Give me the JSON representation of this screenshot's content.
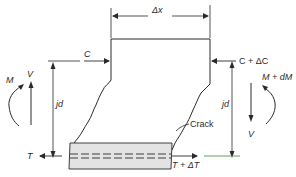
{
  "diagram": {
    "labels": {
      "width": "Δx",
      "compression_left": "C",
      "compression_right": "C + ΔC",
      "moment_left": "M",
      "moment_right": "M + dM",
      "shear_left": "V",
      "shear_right": "V",
      "lever_arm_left": "jd",
      "lever_arm_right": "jd",
      "crack": "Crack",
      "tension_left": "T",
      "tension_right": "T + ΔT"
    },
    "colors": {
      "line": "#2a2a2a",
      "reinforcement_zone": "#e3e3e3",
      "accent_green": "#4a9a4a"
    }
  }
}
